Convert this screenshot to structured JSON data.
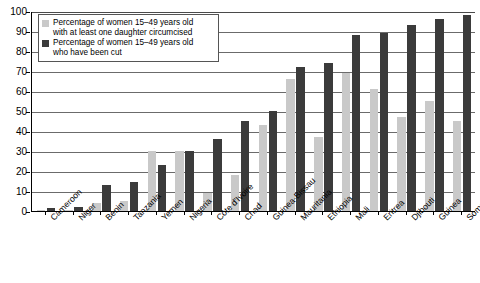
{
  "chart_data": {
    "type": "bar",
    "title": "",
    "subtitle": "",
    "xlabel": "",
    "ylabel": "",
    "ylim": [
      0,
      100
    ],
    "yticks": [
      0,
      10,
      20,
      30,
      40,
      50,
      60,
      70,
      80,
      90,
      100
    ],
    "grid": true,
    "legend_position": "top-left",
    "categories": [
      "Cameroon",
      "Niger",
      "Benin",
      "Tanzania",
      "Yemen",
      "Nigeria",
      "Côte d'Ivoire",
      "Chad",
      "Guinea-Bissau",
      "Mauritania",
      "Ethiopia",
      "Mali",
      "Eritrea",
      "Djibouti",
      "Guinea",
      "Somalia"
    ],
    "series": [
      {
        "name": "Percentage of women 15–49 years old with at least one daughter circumcised",
        "color": "#c9c9c9",
        "values": [
          0.4,
          0.6,
          4,
          5,
          30,
          30,
          9,
          18,
          43,
          66,
          37,
          69,
          61,
          47,
          55,
          45
        ]
      },
      {
        "name": "Percentage of women 15–49 years old who have been cut",
        "color": "#3b3b3b",
        "values": [
          1.4,
          2.2,
          13,
          14.5,
          23,
          30,
          36,
          45,
          50,
          72,
          74,
          88,
          89,
          93,
          96,
          98
        ]
      }
    ]
  },
  "legend": {
    "items": [
      {
        "swatch": "light",
        "line1": "Percentage of women 15–49 years old",
        "line2": "with at least one daughter circumcised"
      },
      {
        "swatch": "dark",
        "line1": "Percentage of women 15–49 years old",
        "line2": "who have been cut"
      }
    ]
  },
  "axis": {
    "y_tick_labels": [
      "100",
      "90",
      "80",
      "70",
      "60",
      "50",
      "40",
      "30",
      "20",
      "10",
      "0"
    ]
  }
}
